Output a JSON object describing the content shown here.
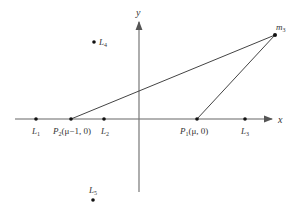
{
  "diagram": {
    "axes": {
      "x_label": "x",
      "y_label": "y"
    },
    "points": {
      "L1": {
        "label": "L",
        "sub": "1"
      },
      "P2": {
        "label": "P",
        "sub": "2",
        "coords": "(μ−1, 0)"
      },
      "L2": {
        "label": "L",
        "sub": "2"
      },
      "P1": {
        "label": "P",
        "sub": "1",
        "coords": "(μ, 0)"
      },
      "L3": {
        "label": "L",
        "sub": "3"
      },
      "L4": {
        "label": "L",
        "sub": "4"
      },
      "L5": {
        "label": "L",
        "sub": "5"
      },
      "m3": {
        "label": "m",
        "sub": "3"
      }
    },
    "colors": {
      "line": "#444444",
      "axis": "#666666",
      "point": "#111111"
    }
  }
}
